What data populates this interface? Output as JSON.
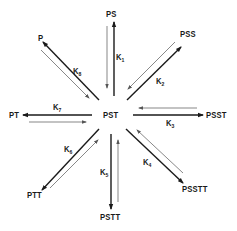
{
  "diagram": {
    "center": {
      "label": "PST"
    },
    "nodes": [
      {
        "id": "PS",
        "label": "PS"
      },
      {
        "id": "PSS",
        "label": "PSS"
      },
      {
        "id": "PSST",
        "label": "PSST"
      },
      {
        "id": "PSSTT",
        "label": "PSSTT"
      },
      {
        "id": "PSTT",
        "label": "PSTT"
      },
      {
        "id": "PTT",
        "label": "PTT"
      },
      {
        "id": "PT",
        "label": "PT"
      },
      {
        "id": "P",
        "label": "P"
      }
    ],
    "edges": [
      {
        "from": "PST",
        "to": "PS",
        "k_base": "K",
        "k_sub": "1"
      },
      {
        "from": "PST",
        "to": "PSS",
        "k_base": "K",
        "k_sub": "2"
      },
      {
        "from": "PST",
        "to": "PSST",
        "k_base": "K",
        "k_sub": "3"
      },
      {
        "from": "PST",
        "to": "PSSTT",
        "k_base": "K",
        "k_sub": "4"
      },
      {
        "from": "PST",
        "to": "PSTT",
        "k_base": "K",
        "k_sub": "5"
      },
      {
        "from": "PST",
        "to": "PTT",
        "k_base": "K",
        "k_sub": "6"
      },
      {
        "from": "PST",
        "to": "PT",
        "k_base": "K",
        "k_sub": "7"
      },
      {
        "from": "PST",
        "to": "P",
        "k_base": "K",
        "k_sub": "8"
      }
    ],
    "colors": {
      "forward": "#1a1a1a",
      "reverse": "#555555"
    }
  }
}
